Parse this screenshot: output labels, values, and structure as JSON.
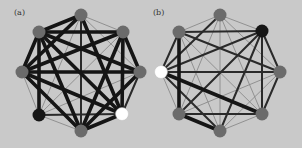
{
  "colors": {
    "background": "#c9c9c9",
    "node_default": "#6b6b6b",
    "node_black": "#161616",
    "node_white": "#ffffff",
    "edge_thick": "#151515",
    "edge_medium": "#2a2a2a",
    "edge_thin": "#8a8a8a"
  },
  "edge_styles": {
    "thick": {
      "width": 3.6,
      "color": "#151515"
    },
    "medium": {
      "width": 2.0,
      "color": "#2a2a2a"
    },
    "thin": {
      "width": 0.9,
      "color": "#8a8a8a"
    }
  },
  "node_radius": 6.5,
  "panels": [
    {
      "label": "(a)",
      "label_pos": [
        14,
        8
      ],
      "nodes": [
        {
          "id": 0,
          "name": "top",
          "x": 81,
          "y": 15,
          "fill": "default"
        },
        {
          "id": 1,
          "name": "top-right",
          "x": 123,
          "y": 32,
          "fill": "default"
        },
        {
          "id": 2,
          "name": "right",
          "x": 140,
          "y": 72,
          "fill": "default"
        },
        {
          "id": 3,
          "name": "bottom-right",
          "x": 122,
          "y": 114,
          "fill": "white"
        },
        {
          "id": 4,
          "name": "bottom",
          "x": 81,
          "y": 131,
          "fill": "default"
        },
        {
          "id": 5,
          "name": "bottom-left",
          "x": 39,
          "y": 115,
          "fill": "black"
        },
        {
          "id": 6,
          "name": "left",
          "x": 22,
          "y": 72,
          "fill": "default"
        },
        {
          "id": 7,
          "name": "top-left",
          "x": 39,
          "y": 32,
          "fill": "default"
        }
      ],
      "edges": [
        [
          0,
          1,
          "thin"
        ],
        [
          0,
          2,
          "thin"
        ],
        [
          0,
          3,
          "thick"
        ],
        [
          0,
          4,
          "medium"
        ],
        [
          0,
          5,
          "thin"
        ],
        [
          0,
          6,
          "thick"
        ],
        [
          0,
          7,
          "thick"
        ],
        [
          1,
          2,
          "thick"
        ],
        [
          1,
          3,
          "thick"
        ],
        [
          1,
          4,
          "thick"
        ],
        [
          1,
          5,
          "thin"
        ],
        [
          1,
          6,
          "thick"
        ],
        [
          1,
          7,
          "thick"
        ],
        [
          2,
          3,
          "medium"
        ],
        [
          2,
          4,
          "thick"
        ],
        [
          2,
          5,
          "thin"
        ],
        [
          2,
          6,
          "thick"
        ],
        [
          2,
          7,
          "thick"
        ],
        [
          3,
          4,
          "thick"
        ],
        [
          3,
          5,
          "medium"
        ],
        [
          3,
          6,
          "thick"
        ],
        [
          3,
          7,
          "thick"
        ],
        [
          4,
          5,
          "thin"
        ],
        [
          4,
          6,
          "thick"
        ],
        [
          4,
          7,
          "thick"
        ],
        [
          5,
          6,
          "thin"
        ],
        [
          5,
          7,
          "thick"
        ],
        [
          6,
          7,
          "thick"
        ]
      ]
    },
    {
      "label": "(b)",
      "label_pos": [
        153,
        8
      ],
      "nodes": [
        {
          "id": 0,
          "name": "top",
          "x": 220,
          "y": 15,
          "fill": "default"
        },
        {
          "id": 1,
          "name": "top-right",
          "x": 262,
          "y": 31,
          "fill": "black"
        },
        {
          "id": 2,
          "name": "right",
          "x": 280,
          "y": 72,
          "fill": "default"
        },
        {
          "id": 3,
          "name": "bottom-right",
          "x": 262,
          "y": 114,
          "fill": "default"
        },
        {
          "id": 4,
          "name": "bottom",
          "x": 220,
          "y": 131,
          "fill": "default"
        },
        {
          "id": 5,
          "name": "bottom-left",
          "x": 179,
          "y": 114,
          "fill": "default"
        },
        {
          "id": 6,
          "name": "left",
          "x": 161,
          "y": 72,
          "fill": "white"
        },
        {
          "id": 7,
          "name": "top-left",
          "x": 179,
          "y": 32,
          "fill": "default"
        }
      ],
      "edges": [
        [
          0,
          1,
          "thin"
        ],
        [
          0,
          2,
          "thin"
        ],
        [
          0,
          3,
          "thin"
        ],
        [
          0,
          4,
          "thin"
        ],
        [
          0,
          5,
          "thin"
        ],
        [
          0,
          6,
          "medium"
        ],
        [
          0,
          7,
          "thin"
        ],
        [
          1,
          2,
          "medium"
        ],
        [
          1,
          3,
          "medium"
        ],
        [
          1,
          4,
          "medium"
        ],
        [
          1,
          5,
          "medium"
        ],
        [
          1,
          6,
          "medium"
        ],
        [
          1,
          7,
          "medium"
        ],
        [
          2,
          3,
          "medium"
        ],
        [
          2,
          4,
          "thin"
        ],
        [
          2,
          5,
          "thin"
        ],
        [
          2,
          6,
          "medium"
        ],
        [
          2,
          7,
          "medium"
        ],
        [
          3,
          4,
          "thin"
        ],
        [
          3,
          5,
          "medium"
        ],
        [
          3,
          6,
          "thick"
        ],
        [
          3,
          7,
          "thin"
        ],
        [
          4,
          5,
          "thick"
        ],
        [
          4,
          6,
          "medium"
        ],
        [
          4,
          7,
          "thin"
        ],
        [
          5,
          6,
          "thin"
        ],
        [
          5,
          7,
          "thick"
        ],
        [
          6,
          7,
          "medium"
        ]
      ]
    }
  ]
}
